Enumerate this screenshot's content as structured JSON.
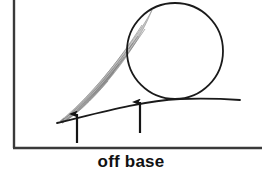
{
  "figure": {
    "caption": "off base",
    "background_color": "#ffffff",
    "ink_color": "#1a1a1a",
    "plume_color": "#9a9a9a",
    "axis": {
      "left_axis_x": 14,
      "left_axis_top_y": 0,
      "left_axis_bottom_y": 148,
      "bottom_axis_y": 148,
      "bottom_axis_x_start": 14,
      "bottom_axis_x_end": 262,
      "stroke_width": 2.4
    },
    "circle": {
      "label": "circle",
      "cx": 175,
      "cy": 51,
      "r": 48,
      "stroke_width": 1.8,
      "fill": "none"
    },
    "ground_curve": {
      "label": "base-curve",
      "start_x": 57,
      "start_y": 123,
      "end_x": 240,
      "end_y": 100,
      "stroke_width": 1.8
    },
    "plume": {
      "label": "striated-wedge",
      "tip_x": 60,
      "tip_y": 120,
      "head_x": 150,
      "head_y": 10,
      "striation_count": 9
    },
    "arrows": [
      {
        "name": "arrow-left",
        "x": 77,
        "tip_y": 112,
        "tail_y": 143
      },
      {
        "name": "arrow-right",
        "x": 140,
        "tip_y": 100,
        "tail_y": 133
      }
    ]
  }
}
